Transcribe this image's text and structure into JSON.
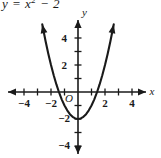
{
  "figure": {
    "width": 161,
    "height": 158,
    "background": "#ffffff",
    "ink_color": "#1a1a1a",
    "equation_prefix": "y = x",
    "equation_exponent": "2",
    "equation_suffix": " − 2"
  },
  "chart_data": {
    "type": "line",
    "xlabel": "x",
    "ylabel": "y",
    "xlim": [
      -5.8,
      6.1
    ],
    "ylim": [
      -5.2,
      5.4
    ],
    "grid": false,
    "legend": null,
    "origin_label": "O",
    "x_tick_values": [
      -5,
      -4,
      -3,
      -2,
      -1,
      1,
      2,
      3,
      4,
      5
    ],
    "x_tick_labels": [
      "",
      "−4",
      "",
      "−2",
      "",
      "",
      "2",
      "",
      "4",
      ""
    ],
    "y_tick_values": [
      -4,
      -3,
      -2,
      -1,
      1,
      2,
      3,
      4
    ],
    "y_tick_labels": [
      "−4",
      "",
      "−2",
      "",
      "",
      "2",
      "",
      "4"
    ],
    "function": "y = x^2 - 2",
    "vertex": [
      0,
      -2
    ],
    "x_intercepts": [
      -1.414,
      1.414
    ],
    "y_intercept": -2,
    "curve_x_range": [
      -2.65,
      2.65
    ],
    "arrow_heads": [
      "left-arm-up",
      "right-arm-up",
      "x-axis-left",
      "x-axis-right",
      "y-axis-up",
      "y-axis-down"
    ],
    "points": [
      {
        "x": -2.65,
        "y": 5.02
      },
      {
        "x": -2.4,
        "y": 3.76
      },
      {
        "x": -2.2,
        "y": 2.84
      },
      {
        "x": -2.0,
        "y": 2.0
      },
      {
        "x": -1.8,
        "y": 1.24
      },
      {
        "x": -1.6,
        "y": 0.56
      },
      {
        "x": -1.414,
        "y": 0.0
      },
      {
        "x": -1.2,
        "y": -0.56
      },
      {
        "x": -1.0,
        "y": -1.0
      },
      {
        "x": -0.8,
        "y": -1.36
      },
      {
        "x": -0.6,
        "y": -1.64
      },
      {
        "x": -0.4,
        "y": -1.84
      },
      {
        "x": -0.2,
        "y": -1.96
      },
      {
        "x": 0.0,
        "y": -2.0
      },
      {
        "x": 0.2,
        "y": -1.96
      },
      {
        "x": 0.4,
        "y": -1.84
      },
      {
        "x": 0.6,
        "y": -1.64
      },
      {
        "x": 0.8,
        "y": -1.36
      },
      {
        "x": 1.0,
        "y": -1.0
      },
      {
        "x": 1.2,
        "y": -0.56
      },
      {
        "x": 1.414,
        "y": 0.0
      },
      {
        "x": 1.6,
        "y": 0.56
      },
      {
        "x": 1.8,
        "y": 1.24
      },
      {
        "x": 2.0,
        "y": 2.0
      },
      {
        "x": 2.2,
        "y": 2.84
      },
      {
        "x": 2.4,
        "y": 3.76
      },
      {
        "x": 2.65,
        "y": 5.02
      }
    ]
  },
  "labels": {
    "x_axis_name": "x",
    "y_axis_name": "y",
    "origin": "O",
    "x_neg4": "−4",
    "x_neg2": "−2",
    "x_pos2": "2",
    "x_pos4": "4",
    "y_neg4": "−4",
    "y_neg2": "−2",
    "y_pos2": "2",
    "y_pos4": "4"
  }
}
